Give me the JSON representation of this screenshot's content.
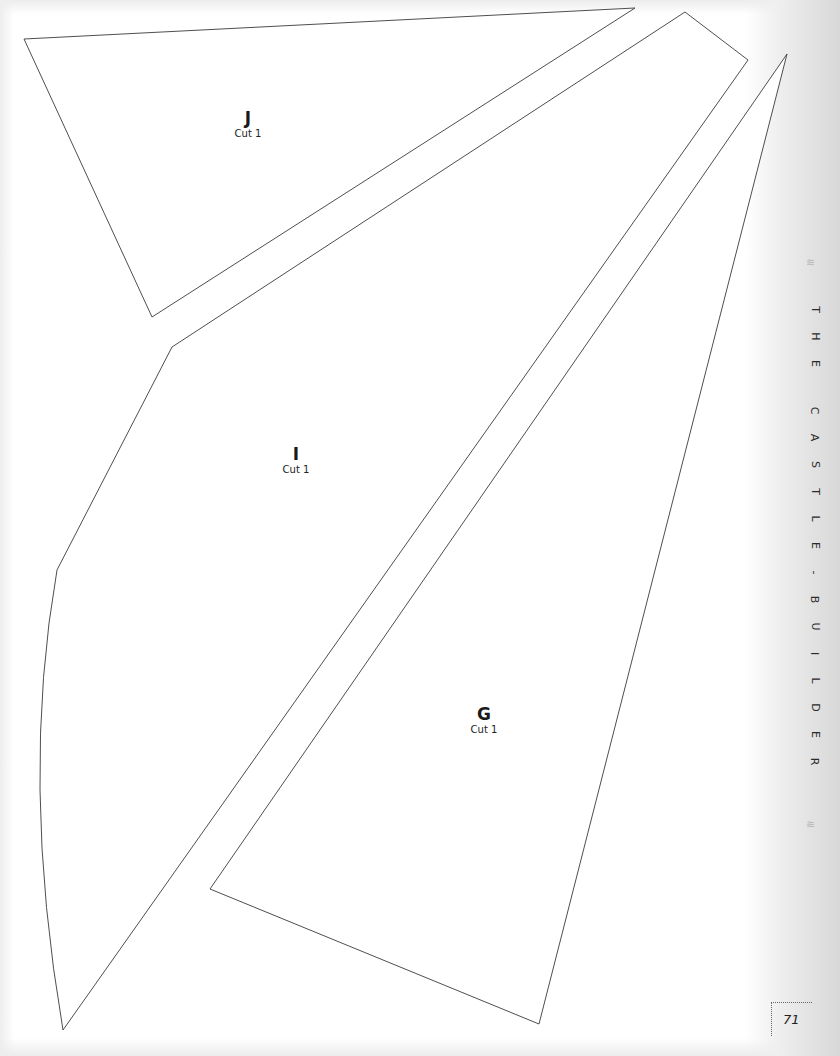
{
  "pattern_pieces": [
    {
      "id": "J",
      "letter": "J",
      "instruction": "Cut 1",
      "points": "24,39 635,8 152,317"
    },
    {
      "id": "I",
      "letter": "I",
      "instruction": "Cut 1",
      "path": "M 172,347 L 685,12 L 748,60 L 63,1030 Q 20,780 57,570 Z"
    },
    {
      "id": "G",
      "letter": "G",
      "instruction": "Cut 1",
      "points": "787,54 539,1024 210,889"
    }
  ],
  "running_head": {
    "words": [
      "THE",
      "CASTLE-BUILDER"
    ],
    "ornament": "≋"
  },
  "folio": {
    "page_number": "71"
  },
  "colors": {
    "outline": "#3a3a3a",
    "text": "#1a1a1a",
    "margin_shade": "#dcdcdc"
  }
}
